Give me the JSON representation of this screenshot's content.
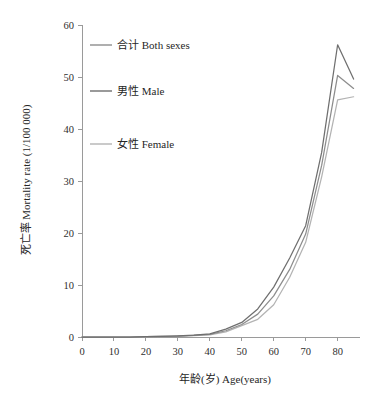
{
  "chart_data": {
    "type": "line",
    "title": "",
    "xlabel": "年龄(岁) Age(years)",
    "ylabel": "死亡率 Mortality rate (1/100 000)",
    "xlim": [
      0,
      87
    ],
    "ylim": [
      0,
      60
    ],
    "xticks": [
      0,
      10,
      20,
      30,
      40,
      50,
      60,
      70,
      80
    ],
    "yticks": [
      0,
      10,
      20,
      30,
      40,
      50,
      60
    ],
    "grid": false,
    "legend_position": "upper-left-inside",
    "x": [
      0,
      5,
      10,
      15,
      20,
      25,
      30,
      35,
      40,
      45,
      50,
      55,
      60,
      65,
      70,
      75,
      80,
      85
    ],
    "series": [
      {
        "name": "合计 Both sexes",
        "label_cn": "合计",
        "label_en": "Both sexes",
        "color": "#8d8d8d",
        "values": [
          0.0,
          0.0,
          0.0,
          0.0,
          0.05,
          0.1,
          0.15,
          0.3,
          0.5,
          1.2,
          2.4,
          4.4,
          7.9,
          13.0,
          19.8,
          33.0,
          50.3,
          47.8
        ]
      },
      {
        "name": "男性 Male",
        "label_cn": "男性",
        "label_en": "Male",
        "color": "#6f6f6f",
        "values": [
          0.0,
          0.0,
          0.0,
          0.0,
          0.05,
          0.1,
          0.2,
          0.35,
          0.6,
          1.5,
          2.8,
          5.4,
          9.6,
          15.2,
          21.4,
          35.5,
          56.2,
          49.6
        ]
      },
      {
        "name": "女性 Female",
        "label_cn": "女性",
        "label_en": "Female",
        "color": "#b3b3b3",
        "values": [
          0.0,
          0.0,
          0.0,
          0.0,
          0.05,
          0.1,
          0.12,
          0.25,
          0.4,
          1.0,
          2.2,
          3.4,
          6.2,
          11.5,
          18.2,
          30.8,
          45.6,
          46.2
        ]
      }
    ]
  },
  "legend": {
    "entries": [
      {
        "label": "合计 Both sexes"
      },
      {
        "label": "男性 Male"
      },
      {
        "label": "女性 Female"
      }
    ]
  },
  "axes": {
    "y_title": "死亡率 Mortality rate (1/100 000)",
    "x_title": "年龄(岁) Age(years)",
    "y_tick_labels": [
      "0",
      "10",
      "20",
      "30",
      "40",
      "50",
      "60"
    ],
    "x_tick_labels": [
      "0",
      "10",
      "20",
      "30",
      "40",
      "50",
      "60",
      "70",
      "80"
    ]
  },
  "colors": {
    "both_sexes": "#8d8d8d",
    "male": "#6f6f6f",
    "female": "#b3b3b3",
    "axis": "#9a9a9a",
    "text": "#262626",
    "background": "#ffffff"
  }
}
